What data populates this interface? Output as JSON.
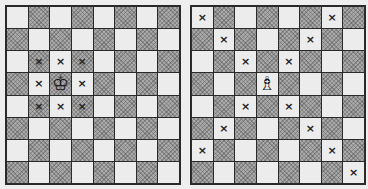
{
  "boards": [
    {
      "name": "king-moves-board",
      "size": 8,
      "piece": {
        "type": "king",
        "glyph": "♔",
        "row": 4,
        "col": 3
      },
      "marks": [
        [
          3,
          2
        ],
        [
          3,
          3
        ],
        [
          3,
          4
        ],
        [
          4,
          2
        ],
        [
          4,
          4
        ],
        [
          5,
          2
        ],
        [
          5,
          3
        ],
        [
          5,
          4
        ]
      ]
    },
    {
      "name": "bishop-moves-board",
      "size": 8,
      "piece": {
        "type": "bishop",
        "glyph": "♗",
        "row": 4,
        "col": 4
      },
      "marks": [
        [
          1,
          1
        ],
        [
          1,
          7
        ],
        [
          2,
          2
        ],
        [
          2,
          6
        ],
        [
          3,
          3
        ],
        [
          3,
          5
        ],
        [
          5,
          3
        ],
        [
          5,
          5
        ],
        [
          6,
          2
        ],
        [
          6,
          6
        ],
        [
          7,
          1
        ],
        [
          7,
          7
        ],
        [
          8,
          8
        ]
      ]
    }
  ],
  "mark_glyph": "×",
  "colors": {
    "light": "#ececec",
    "dark": "#a9a9a9",
    "border": "#2a2a2a"
  }
}
